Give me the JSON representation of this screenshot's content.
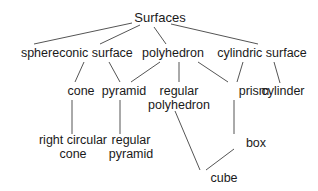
{
  "diagram": {
    "type": "hierarchy",
    "root": "Surfaces",
    "nodes": {
      "surfaces": {
        "label": "Surfaces",
        "lines": [
          "Surfaces"
        ],
        "x": 160,
        "y": 22
      },
      "sphere": {
        "label": "sphere",
        "lines": [
          "sphere"
        ],
        "x": 40,
        "y": 57
      },
      "conic_surface": {
        "label": "conic surface",
        "lines": [
          "conic surface"
        ],
        "x": 96,
        "y": 57
      },
      "polyhedron": {
        "label": "polyhedron",
        "lines": [
          "polyhedron"
        ],
        "x": 173,
        "y": 57
      },
      "cylindric_surface": {
        "label": "cylindric surface",
        "lines": [
          "cylindric surface"
        ],
        "x": 262,
        "y": 57
      },
      "cone": {
        "label": "cone",
        "lines": [
          "cone"
        ],
        "x": 81,
        "y": 95
      },
      "pyramid": {
        "label": "pyramid",
        "lines": [
          "pyramid"
        ],
        "x": 124,
        "y": 95
      },
      "regular_polyhedron": {
        "label": "regular polyhedron",
        "lines": [
          "regular",
          "polyhedron"
        ],
        "x": 179,
        "y": 95
      },
      "prism": {
        "label": "prism",
        "lines": [
          "prism"
        ],
        "x": 254,
        "y": 95
      },
      "cylinder": {
        "label": "cylinder",
        "lines": [
          "cylinder"
        ],
        "x": 283,
        "y": 95
      },
      "right_circular_cone": {
        "label": "right circular cone",
        "lines": [
          "right circular",
          "cone"
        ],
        "x": 73,
        "y": 144
      },
      "regular_pyramid": {
        "label": "regular pyramid",
        "lines": [
          "regular",
          "pyramid"
        ],
        "x": 131,
        "y": 144
      },
      "box": {
        "label": "box",
        "lines": [
          "box"
        ],
        "x": 256,
        "y": 147
      },
      "cube": {
        "label": "cube",
        "lines": [
          "cube"
        ],
        "x": 224,
        "y": 182
      }
    },
    "edges": [
      {
        "from": "surfaces",
        "to": "sphere",
        "x1": 132,
        "y1": 23,
        "x2": 34,
        "y2": 44
      },
      {
        "from": "surfaces",
        "to": "conic_surface",
        "x1": 140,
        "y1": 25,
        "x2": 100,
        "y2": 44
      },
      {
        "from": "surfaces",
        "to": "polyhedron",
        "x1": 154,
        "y1": 27,
        "x2": 166,
        "y2": 44
      },
      {
        "from": "surfaces",
        "to": "cylindric_surface",
        "x1": 171,
        "y1": 24,
        "x2": 258,
        "y2": 44
      },
      {
        "from": "conic_surface",
        "to": "cone",
        "x1": 84,
        "y1": 62,
        "x2": 75,
        "y2": 82
      },
      {
        "from": "conic_surface",
        "to": "pyramid",
        "x1": 109,
        "y1": 62,
        "x2": 120,
        "y2": 82
      },
      {
        "from": "polyhedron",
        "to": "pyramid",
        "x1": 160,
        "y1": 62,
        "x2": 131,
        "y2": 82
      },
      {
        "from": "polyhedron",
        "to": "regular_polyhedron",
        "x1": 179,
        "y1": 62,
        "x2": 179,
        "y2": 82
      },
      {
        "from": "polyhedron",
        "to": "prism",
        "x1": 198,
        "y1": 62,
        "x2": 228,
        "y2": 82
      },
      {
        "from": "cylindric_surface",
        "to": "prism",
        "x1": 243,
        "y1": 62,
        "x2": 237,
        "y2": 82
      },
      {
        "from": "cylindric_surface",
        "to": "cylinder",
        "x1": 274,
        "y1": 62,
        "x2": 280,
        "y2": 83
      },
      {
        "from": "cone",
        "to": "right_circular_cone",
        "x1": 72,
        "y1": 100,
        "x2": 72,
        "y2": 134
      },
      {
        "from": "pyramid",
        "to": "regular_pyramid",
        "x1": 120,
        "y1": 100,
        "x2": 120,
        "y2": 134
      },
      {
        "from": "regular_polyhedron",
        "to": "cube",
        "x1": 175,
        "y1": 111,
        "x2": 200,
        "y2": 170
      },
      {
        "from": "prism",
        "to": "box",
        "x1": 234,
        "y1": 100,
        "x2": 234,
        "y2": 134
      },
      {
        "from": "box",
        "to": "cube",
        "x1": 234,
        "y1": 149,
        "x2": 206,
        "y2": 170
      }
    ]
  }
}
